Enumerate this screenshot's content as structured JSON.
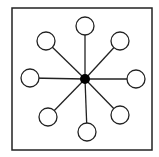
{
  "diagram": {
    "type": "star-network",
    "frame": {
      "x": 12,
      "y": 8,
      "width": 140,
      "height": 142,
      "stroke": "#222222"
    },
    "hub": {
      "cx": 85,
      "cy": 79,
      "r": 5,
      "fill": "#000000"
    },
    "nodes": [
      {
        "name": "top",
        "cx": 85,
        "cy": 26
      },
      {
        "name": "top-right",
        "cx": 120,
        "cy": 41
      },
      {
        "name": "right",
        "cx": 136,
        "cy": 79
      },
      {
        "name": "bottom-right",
        "cx": 120,
        "cy": 115
      },
      {
        "name": "bottom",
        "cx": 87,
        "cy": 132
      },
      {
        "name": "bottom-left",
        "cx": 48,
        "cy": 117
      },
      {
        "name": "left",
        "cx": 30,
        "cy": 78
      },
      {
        "name": "top-left",
        "cx": 46,
        "cy": 41
      }
    ],
    "node_radius": 9,
    "stroke_color": "#222222",
    "fill_color": "#ffffff"
  }
}
